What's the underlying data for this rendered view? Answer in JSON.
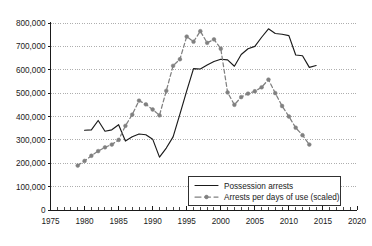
{
  "chart_data": {
    "type": "line",
    "title": "",
    "subtitle": "",
    "xlabel": "",
    "ylabel": "",
    "xlim": [
      1975,
      2020
    ],
    "ylim": [
      0,
      800000
    ],
    "x_ticks": [
      1975,
      1980,
      1985,
      1990,
      1995,
      2000,
      2005,
      2010,
      2015,
      2020
    ],
    "x_tick_labels": [
      "1975",
      "1980",
      "1985",
      "1990",
      "1995",
      "2000",
      "2005",
      "2010",
      "2015",
      "2020"
    ],
    "x_minor_tick_interval": 1,
    "y_ticks": [
      0,
      100000,
      200000,
      300000,
      400000,
      500000,
      600000,
      700000,
      800000
    ],
    "y_tick_labels": [
      "0",
      "100,000",
      "200,000",
      "300,000",
      "400,000",
      "500,000",
      "600,000",
      "700,000",
      "800,000"
    ],
    "grid": "horizontal-dotted",
    "legend_position": "bottom-right",
    "series": [
      {
        "name": "Possession arrests",
        "style": "solid",
        "color": "#1a1a1a",
        "markers": false,
        "x": [
          1980,
          1981,
          1982,
          1983,
          1984,
          1985,
          1986,
          1987,
          1988,
          1989,
          1990,
          1991,
          1992,
          1993,
          1994,
          1995,
          1996,
          1997,
          1998,
          1999,
          2000,
          2001,
          2002,
          2003,
          2004,
          2005,
          2006,
          2007,
          2008,
          2009,
          2010,
          2011,
          2012,
          2013,
          2014
        ],
        "y": [
          341000,
          343000,
          383000,
          337000,
          343000,
          365000,
          295000,
          313000,
          325000,
          322000,
          303000,
          226000,
          265000,
          313000,
          410000,
          510000,
          605000,
          603000,
          620000,
          635000,
          645000,
          642000,
          615000,
          665000,
          690000,
          700000,
          739000,
          775000,
          755000,
          752000,
          746000,
          663000,
          660000,
          610000,
          618000
        ]
      },
      {
        "name": "Arrests per days of use (scaled)",
        "style": "dashed-with-markers",
        "color": "#808080",
        "markers": true,
        "x": [
          1979,
          1980,
          1981,
          1982,
          1983,
          1984,
          1985,
          1986,
          1987,
          1988,
          1989,
          1990,
          1991,
          1992,
          1993,
          1994,
          1995,
          1996,
          1997,
          1998,
          1999,
          2000,
          2001,
          2002,
          2003,
          2004,
          2005,
          2006,
          2007,
          2008,
          2009,
          2010,
          2011,
          2012,
          2013
        ],
        "y": [
          190000,
          210000,
          232000,
          252000,
          268000,
          280000,
          300000,
          360000,
          408000,
          468000,
          452000,
          430000,
          405000,
          510000,
          617000,
          645000,
          742000,
          720000,
          765000,
          715000,
          730000,
          690000,
          503000,
          450000,
          483000,
          498000,
          508000,
          525000,
          558000,
          500000,
          445000,
          400000,
          352000,
          320000,
          280000
        ]
      }
    ]
  },
  "legend": {
    "items": [
      {
        "label": "Possession arrests",
        "style": "solid"
      },
      {
        "label": "Arrests per days of use (scaled)",
        "style": "dashed-marker"
      }
    ]
  }
}
